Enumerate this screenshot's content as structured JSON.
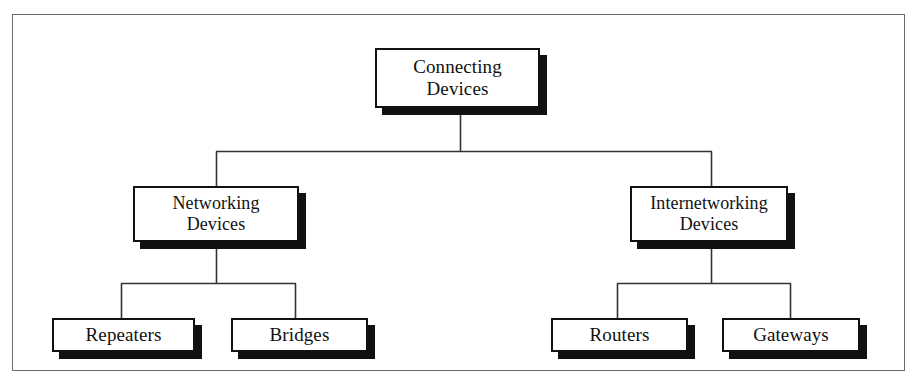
{
  "diagram": {
    "type": "tree",
    "title": "Connecting Devices",
    "root": {
      "id": "connecting-devices",
      "label": "Connecting\nDevices"
    },
    "level_two": [
      {
        "id": "networking-devices",
        "label": "Networking\nDevices"
      },
      {
        "id": "internetworking-devices",
        "label": "Internetworking\nDevices"
      }
    ],
    "leaves": [
      {
        "id": "repeaters",
        "label": "Repeaters",
        "parent": "networking-devices"
      },
      {
        "id": "bridges",
        "label": "Bridges",
        "parent": "networking-devices"
      },
      {
        "id": "routers",
        "label": "Routers",
        "parent": "internetworking-devices"
      },
      {
        "id": "gateways",
        "label": "Gateways",
        "parent": "internetworking-devices"
      }
    ],
    "style": {
      "box_border_color": "#111111",
      "box_fill_color": "#ffffff",
      "shadow_color": "#111111",
      "connector_color": "#333333",
      "frame_color": "#6b6b6b",
      "page_background": "#ffffff"
    }
  }
}
